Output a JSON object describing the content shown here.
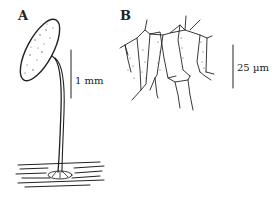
{
  "figure": {
    "panels": [
      {
        "label": "A",
        "description": "Stalked sporocarp on substrate",
        "scale_bar": "1 mm"
      },
      {
        "label": "B",
        "description": "Cellular network with stippled cells",
        "scale_bar": "25 µm"
      }
    ]
  }
}
